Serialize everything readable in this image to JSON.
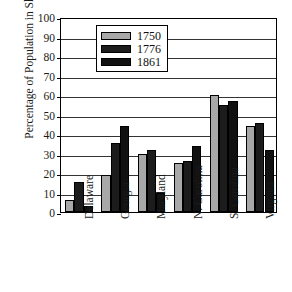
{
  "chart_data": {
    "type": "bar",
    "title": "",
    "subtitle": "",
    "xlabel": "",
    "ylabel": "Percentage of Population in Slavery",
    "ylim": [
      0,
      100
    ],
    "yticks": [
      0,
      10,
      20,
      30,
      40,
      50,
      60,
      70,
      80,
      90,
      100
    ],
    "grid": "horizontal",
    "legend_position": "inside-upper-left",
    "categories": [
      "Delaware",
      "Georgia",
      "Maryland",
      "N. Carolina",
      "S. Carolina",
      "Virginia"
    ],
    "series": [
      {
        "name": "1750",
        "color": "#a8a8a8",
        "values": [
          6,
          19,
          30,
          25,
          60,
          44
        ]
      },
      {
        "name": "1776",
        "color": "#1c1c1c",
        "values": [
          15.5,
          35.5,
          32,
          26,
          55,
          45.5
        ]
      },
      {
        "name": "1861",
        "color": "#111111",
        "values": [
          3,
          44,
          10,
          34,
          57,
          32
        ]
      }
    ]
  },
  "axis": {
    "y_title": "Percentage of Population in Slavery",
    "y_tick_labels": [
      "100",
      "90",
      "80",
      "70",
      "60",
      "50",
      "40",
      "30",
      "20",
      "10",
      "0"
    ],
    "x_tick_labels": [
      "Delaware",
      "Georgia",
      "Maryland",
      "N. Carolina",
      "S. Carolina",
      "Virginia"
    ]
  },
  "legend": {
    "entries": [
      {
        "label": "1750",
        "swatch": "#a8a8a8"
      },
      {
        "label": "1776",
        "swatch": "#1c1c1c"
      },
      {
        "label": "1861",
        "swatch": "#111111"
      }
    ]
  }
}
